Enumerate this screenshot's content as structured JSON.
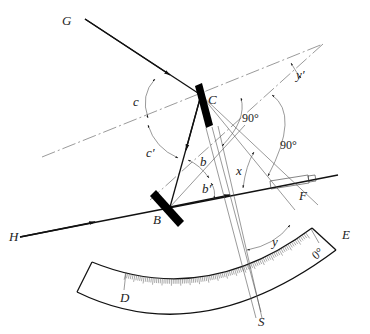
{
  "diagram": {
    "labels": {
      "G": "G",
      "H": "H",
      "C": "C",
      "B": "B",
      "F": "F",
      "E": "E",
      "D": "D",
      "S": "S",
      "c": "c",
      "c_prime": "c′",
      "b": "b",
      "b_prime": "b′",
      "x": "x",
      "y": "y",
      "y_prime": "y′",
      "angle_90_upper": "90°",
      "angle_90_lower": "90°",
      "zero_mark": "0°"
    },
    "components": [
      {
        "id": "mirror-C",
        "description": "index mirror at C"
      },
      {
        "id": "mirror-B",
        "description": "horizon mirror at B"
      },
      {
        "id": "telescope-F",
        "description": "telescope at F"
      },
      {
        "id": "index-arm",
        "description": "index arm from C to S"
      },
      {
        "id": "scale-arc",
        "description": "graduated arc from D to E with 0° mark"
      }
    ],
    "colors": {
      "line": "#111111",
      "thin_line": "#555555",
      "background": "#ffffff"
    }
  }
}
